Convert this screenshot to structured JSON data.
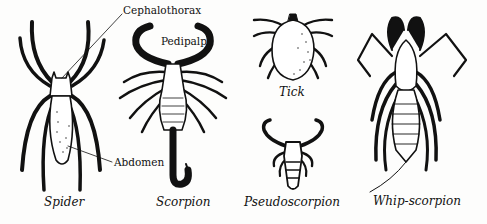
{
  "figure": {
    "ink_color": "#111111",
    "paper_color": "#fdfdfc",
    "specimens": [
      {
        "id": "spider",
        "caption": "Spider"
      },
      {
        "id": "scorpion",
        "caption": "Scorpion"
      },
      {
        "id": "tick",
        "caption": "Tick"
      },
      {
        "id": "pseudoscorpion",
        "caption": "Pseudoscorpion"
      },
      {
        "id": "whip-scorpion",
        "caption": "Whip-scorpion"
      }
    ],
    "part_labels": {
      "cephalothorax": "Cephalothorax",
      "pedipalp": "Pedipalp",
      "abdomen": "Abdomen"
    }
  }
}
